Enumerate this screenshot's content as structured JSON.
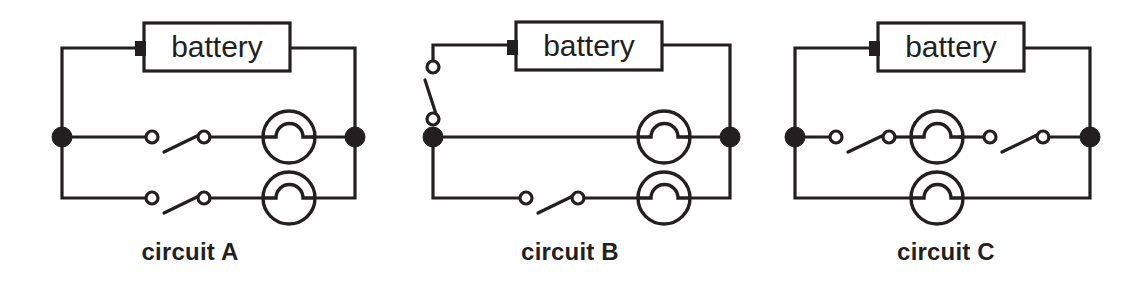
{
  "figure": {
    "background_color": "#ffffff",
    "ink_color": "#231f20",
    "width": 1136,
    "height": 293
  },
  "circuits": [
    {
      "id": "A",
      "caption": "circuit A",
      "battery_label": "battery",
      "components": {
        "batteries": 1,
        "bulbs": 2,
        "switches": 2,
        "junction_nodes": 2
      },
      "description": "Battery across the top; two parallel branches, each branch containing one open switch in series with one bulb.",
      "branches": [
        {
          "name": "upper-branch",
          "items": [
            "switch",
            "bulb"
          ]
        },
        {
          "name": "lower-branch",
          "items": [
            "switch",
            "bulb"
          ]
        }
      ]
    },
    {
      "id": "B",
      "caption": "circuit B",
      "battery_label": "battery",
      "components": {
        "batteries": 1,
        "bulbs": 2,
        "switches": 2,
        "junction_nodes": 2
      },
      "description": "Battery across the top; one open switch in the main left lead feeding two parallel branches, the upper branch holds a bulb and the lower branch holds a switch in series with a bulb.",
      "branches": [
        {
          "name": "main-lead",
          "items": [
            "switch"
          ]
        },
        {
          "name": "upper-branch",
          "items": [
            "bulb"
          ]
        },
        {
          "name": "lower-branch",
          "items": [
            "switch",
            "bulb"
          ]
        }
      ]
    },
    {
      "id": "C",
      "caption": "circuit C",
      "battery_label": "battery",
      "components": {
        "batteries": 1,
        "bulbs": 2,
        "switches": 2,
        "junction_nodes": 2
      },
      "description": "Battery across the top; two parallel branches, the upper branch holds a switch, a bulb and a second switch in series, the lower branch holds only a bulb.",
      "branches": [
        {
          "name": "upper-branch",
          "items": [
            "switch",
            "bulb",
            "switch"
          ]
        },
        {
          "name": "lower-branch",
          "items": [
            "bulb"
          ]
        }
      ]
    }
  ],
  "symbols": {
    "bulb": "lamp-symbol",
    "switch": "open-switch-symbol",
    "battery": "battery-box-symbol",
    "node": "filled-junction-dot"
  }
}
